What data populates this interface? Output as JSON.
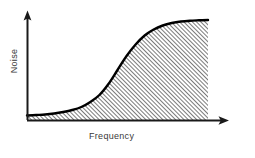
{
  "chart_data": {
    "type": "area",
    "title": "",
    "xlabel": "Frequency",
    "ylabel": "Noise",
    "x": [
      0,
      0.05,
      0.1,
      0.15,
      0.2,
      0.25,
      0.3,
      0.35,
      0.4,
      0.45,
      0.5,
      0.55,
      0.6,
      0.65,
      0.7,
      0.75,
      0.8,
      0.85,
      0.9,
      0.95,
      1.0
    ],
    "values": [
      0.045,
      0.05,
      0.055,
      0.065,
      0.08,
      0.1,
      0.13,
      0.18,
      0.25,
      0.36,
      0.5,
      0.64,
      0.755,
      0.845,
      0.905,
      0.945,
      0.97,
      0.985,
      0.993,
      0.997,
      1.0
    ],
    "series": [
      {
        "name": "Noise",
        "values": [
          0.045,
          0.05,
          0.055,
          0.065,
          0.08,
          0.1,
          0.13,
          0.18,
          0.25,
          0.36,
          0.5,
          0.64,
          0.755,
          0.845,
          0.905,
          0.945,
          0.97,
          0.985,
          0.993,
          0.997,
          1.0
        ]
      }
    ],
    "xlim": [
      0,
      1
    ],
    "ylim": [
      0,
      1.05
    ],
    "grid": false,
    "legend": false,
    "xticks": [],
    "yticks": [],
    "fill": "diagonal-hatch",
    "annotations": []
  },
  "axes": {
    "x_label": "Frequency",
    "y_label": "Noise",
    "x_arrow": true,
    "y_arrow": true
  },
  "style": {
    "background": "#ffffff",
    "curve_color": "#000000",
    "axis_color": "#1a1a1a",
    "hatch_color": "#2b2b2b",
    "label_color": "#3a3a3a",
    "curve_width": 2.4,
    "hatch_angle_deg": 45,
    "hatch_spacing_px": 3
  },
  "geometry": {
    "origin_x": 27,
    "baseline_y": 120,
    "plateau_y": 20,
    "right_edge_x": 208,
    "y_arrow_tip_y": 11,
    "x_arrow_tip_x": 228
  }
}
